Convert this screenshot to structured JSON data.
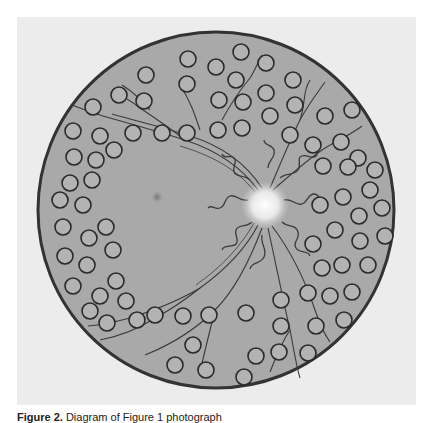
{
  "figure": {
    "caption_label": "Figure 2.",
    "caption_text": "Diagram of Figure 1 photograph",
    "caption_note": "caption is clipped at the bottom edge of the image; only upper halves of letters visible"
  },
  "diagram": {
    "colors": {
      "panel_background": "#ececec",
      "fundus_fill": "#a9a9a9",
      "fundus_border": "#333333",
      "laser_spot_stroke": "#2a2a2a",
      "optic_disc_glow": "#f4f4f4",
      "vessel_stroke": "#3a3a3a"
    },
    "fundus": {
      "cx": 216,
      "cy": 210,
      "r": 178
    },
    "optic_disc": {
      "cx": 265,
      "cy": 205,
      "r": 22,
      "label": "optic disc with neovascularization"
    },
    "macula": {
      "cx": 157,
      "cy": 197,
      "r": 7,
      "label": "macula"
    },
    "laser_spot_radius": 8,
    "laser_spots": [
      [
        241,
        52
      ],
      [
        266,
        63
      ],
      [
        188,
        59
      ],
      [
        216,
        67
      ],
      [
        146,
        75
      ],
      [
        266,
        93
      ],
      [
        236,
        80
      ],
      [
        293,
        80
      ],
      [
        119,
        95
      ],
      [
        187,
        84
      ],
      [
        219,
        100
      ],
      [
        270,
        116
      ],
      [
        295,
        105
      ],
      [
        93,
        107
      ],
      [
        144,
        101
      ],
      [
        243,
        102
      ],
      [
        218,
        130
      ],
      [
        242,
        128
      ],
      [
        290,
        135
      ],
      [
        325,
        116
      ],
      [
        352,
        110
      ],
      [
        73,
        131
      ],
      [
        100,
        136
      ],
      [
        133,
        133
      ],
      [
        162,
        133
      ],
      [
        187,
        133
      ],
      [
        74,
        157
      ],
      [
        96,
        160
      ],
      [
        114,
        150
      ],
      [
        313,
        145
      ],
      [
        341,
        142
      ],
      [
        358,
        158
      ],
      [
        323,
        166
      ],
      [
        348,
        167
      ],
      [
        375,
        170
      ],
      [
        70,
        183
      ],
      [
        92,
        180
      ],
      [
        343,
        197
      ],
      [
        370,
        190
      ],
      [
        320,
        205
      ],
      [
        359,
        216
      ],
      [
        382,
        208
      ],
      [
        83,
        205
      ],
      [
        60,
        200
      ],
      [
        106,
        227
      ],
      [
        63,
        227
      ],
      [
        89,
        238
      ],
      [
        335,
        230
      ],
      [
        360,
        241
      ],
      [
        313,
        244
      ],
      [
        65,
        256
      ],
      [
        87,
        265
      ],
      [
        113,
        250
      ],
      [
        385,
        236
      ],
      [
        342,
        265
      ],
      [
        368,
        265
      ],
      [
        322,
        268
      ],
      [
        73,
        286
      ],
      [
        100,
        296
      ],
      [
        116,
        281
      ],
      [
        330,
        296
      ],
      [
        352,
        292
      ],
      [
        308,
        293
      ],
      [
        90,
        311
      ],
      [
        126,
        301
      ],
      [
        344,
        320
      ],
      [
        107,
        323
      ],
      [
        137,
        320
      ],
      [
        155,
        315
      ],
      [
        183,
        316
      ],
      [
        209,
        315
      ],
      [
        246,
        313
      ],
      [
        281,
        300
      ],
      [
        281,
        326
      ],
      [
        279,
        352
      ],
      [
        316,
        326
      ],
      [
        308,
        353
      ],
      [
        193,
        345
      ],
      [
        175,
        365
      ],
      [
        206,
        370
      ],
      [
        244,
        377
      ],
      [
        256,
        356
      ]
    ]
  }
}
